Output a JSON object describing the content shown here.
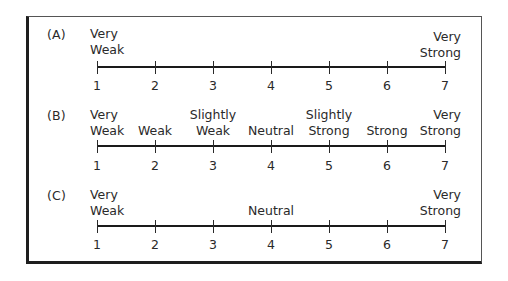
{
  "figure": {
    "type": "rating-scale-comparison",
    "scale_points": [
      1,
      2,
      3,
      4,
      5,
      6,
      7
    ],
    "border_color": "#1e1e1e",
    "line_color": "#1a1a1a",
    "text_color": "#2a2a2a"
  },
  "scales": [
    {
      "letter": "(A)",
      "numbers": [
        "1",
        "2",
        "3",
        "4",
        "5",
        "6",
        "7"
      ],
      "anchors": [
        {
          "point": 1,
          "line1": "Very",
          "line2": "Weak"
        },
        {
          "point": 7,
          "line1": "Very",
          "line2": "Strong"
        }
      ]
    },
    {
      "letter": "(B)",
      "numbers": [
        "1",
        "2",
        "3",
        "4",
        "5",
        "6",
        "7"
      ],
      "anchors": [
        {
          "point": 1,
          "line1": "Very",
          "line2": "Weak"
        },
        {
          "point": 2,
          "line1": "",
          "line2": "Weak"
        },
        {
          "point": 3,
          "line1": "Slightly",
          "line2": "Weak"
        },
        {
          "point": 4,
          "line1": "",
          "line2": "Neutral"
        },
        {
          "point": 5,
          "line1": "Slightly",
          "line2": "Strong"
        },
        {
          "point": 6,
          "line1": "",
          "line2": "Strong"
        },
        {
          "point": 7,
          "line1": "Very",
          "line2": "Strong"
        }
      ]
    },
    {
      "letter": "(C)",
      "numbers": [
        "1",
        "2",
        "3",
        "4",
        "5",
        "6",
        "7"
      ],
      "anchors": [
        {
          "point": 1,
          "line1": "Very",
          "line2": "Weak"
        },
        {
          "point": 4,
          "line1": "",
          "line2": "Neutral"
        },
        {
          "point": 7,
          "line1": "Very",
          "line2": "Strong"
        }
      ]
    }
  ]
}
